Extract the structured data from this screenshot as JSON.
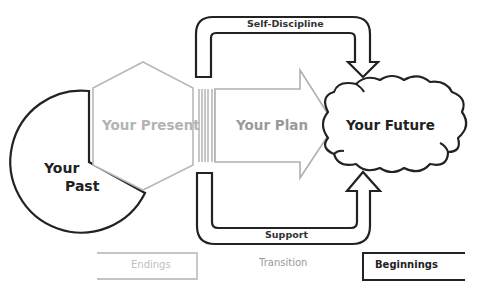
{
  "diagram": {
    "shapes": {
      "past": {
        "label_line1": "Your",
        "label_line2": "Past"
      },
      "present": {
        "label": "Your Present"
      },
      "plan": {
        "label": "Your Plan"
      },
      "future": {
        "label": "Your Future"
      }
    },
    "arrows": {
      "top": {
        "label": "Self-Discipline"
      },
      "bottom": {
        "label": "Support"
      }
    },
    "legend": {
      "endings": "Endings",
      "transition": "Transition",
      "beginnings": "Beginnings"
    },
    "colors": {
      "dark_stroke": "#222222",
      "light_stroke": "#b8b8b8",
      "light_text": "#b3b3b3",
      "mid_text": "#8a8a8a"
    }
  }
}
